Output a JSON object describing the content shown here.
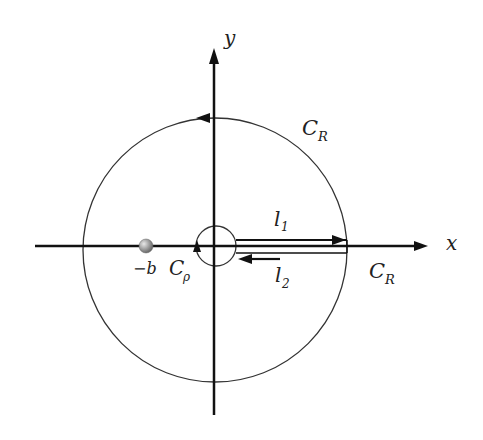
{
  "diagram": {
    "type": "contour-integration",
    "colors": {
      "stroke": "#111111",
      "contour": "#333333",
      "pole": "#8a8a8a",
      "background": "#ffffff"
    },
    "axes": {
      "x_label": "x",
      "y_label": "y"
    },
    "contours": {
      "outer": {
        "name": "C",
        "sub": "R",
        "name2": "C",
        "sub2": "R"
      },
      "inner": {
        "name": "C",
        "sub": "ρ"
      },
      "upper_path": {
        "name": "l",
        "sub": "1"
      },
      "lower_path": {
        "name": "l",
        "sub": "2"
      }
    },
    "pole": {
      "label": "−b"
    }
  }
}
